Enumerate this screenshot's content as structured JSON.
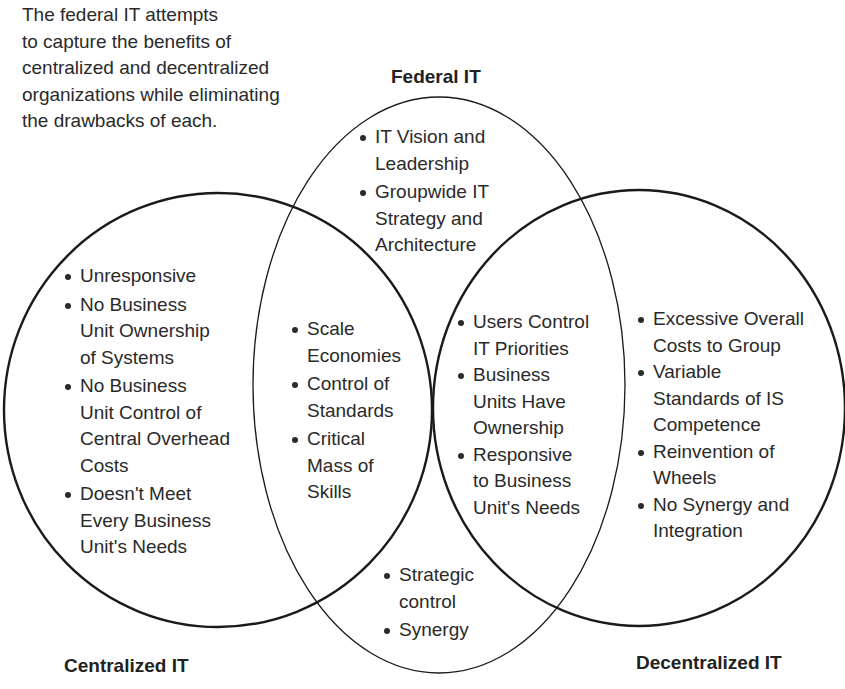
{
  "intro_text": [
    "The federal IT attempts",
    "to capture the benefits of",
    "centralized and decentralized",
    "organizations while eliminating",
    "the drawbacks of each."
  ],
  "labels": {
    "federal": "Federal IT",
    "centralized": "Centralized IT",
    "decentralized": "Decentralized IT"
  },
  "regions": {
    "federal_only": [
      [
        "IT Vision and",
        "Leadership"
      ],
      [
        "Groupwide IT",
        "Strategy and",
        "Architecture"
      ]
    ],
    "centralized_only": [
      [
        "Unresponsive"
      ],
      [
        "No Business",
        "Unit Ownership",
        "of Systems"
      ],
      [
        "No Business",
        "Unit Control of",
        "Central Overhead",
        "Costs"
      ],
      [
        "Doesn't Meet",
        "Every Business",
        "Unit's Needs"
      ]
    ],
    "centralized_federal": [
      [
        "Scale",
        "Economies"
      ],
      [
        "Control of",
        "Standards"
      ],
      [
        "Critical",
        "Mass of",
        "Skills"
      ]
    ],
    "decentralized_federal": [
      [
        "Users Control",
        "IT Priorities"
      ],
      [
        "Business",
        "Units Have",
        "Ownership"
      ],
      [
        "Responsive",
        "to Business",
        "Unit's Needs"
      ]
    ],
    "decentralized_only": [
      [
        "Excessive Overall",
        "Costs to Group"
      ],
      [
        "Variable",
        "Standards of IS",
        "Competence"
      ],
      [
        "Reinvention of",
        "Wheels"
      ],
      [
        "No Synergy and",
        "Integration"
      ]
    ],
    "federal_bottom": [
      [
        "Strategic",
        "control"
      ],
      [
        "Synergy"
      ]
    ]
  },
  "colors": {
    "stroke": "#1a1a1a",
    "text": "#2a2a2a",
    "background": "#ffffff"
  }
}
